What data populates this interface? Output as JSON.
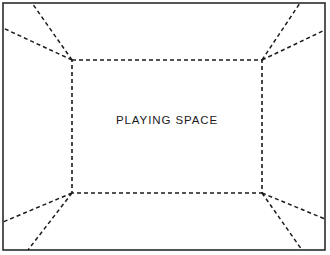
{
  "diagram": {
    "background_color": "#ffffff",
    "canvas": {
      "width": 330,
      "height": 255
    },
    "outer_frame": {
      "name": "outer-boundary",
      "style": "solid",
      "stroke_color": "#2b2b2b",
      "stroke_width": 1.6,
      "x": 3,
      "y": 3,
      "width": 322,
      "height": 247
    },
    "playing_space": {
      "label": "PLAYING SPACE",
      "style": "dashed",
      "stroke_color": "#1b1b1b",
      "stroke_width": 1.6,
      "dash_pattern": "4 3",
      "x": 72,
      "y": 60,
      "width": 190,
      "height": 133
    },
    "sightlines": {
      "style": "dashed",
      "stroke_color": "#1b1b1b",
      "stroke_width": 1.5,
      "dash_pattern": "4 3",
      "count": 8,
      "lines": [
        {
          "name": "sightline-top-left-to-top-edge",
          "x1": 72,
          "y1": 60,
          "x2": 32,
          "y2": 3
        },
        {
          "name": "sightline-top-left-to-left-edge",
          "x1": 72,
          "y1": 60,
          "x2": 3,
          "y2": 28
        },
        {
          "name": "sightline-top-right-to-top-edge",
          "x1": 262,
          "y1": 60,
          "x2": 300,
          "y2": 3
        },
        {
          "name": "sightline-top-right-to-right-edge",
          "x1": 262,
          "y1": 60,
          "x2": 325,
          "y2": 30
        },
        {
          "name": "sightline-bottom-left-to-left-edge",
          "x1": 72,
          "y1": 193,
          "x2": 3,
          "y2": 222
        },
        {
          "name": "sightline-bottom-left-to-bottom-edge",
          "x1": 72,
          "y1": 193,
          "x2": 28,
          "y2": 250
        },
        {
          "name": "sightline-bottom-right-to-right-edge",
          "x1": 262,
          "y1": 193,
          "x2": 325,
          "y2": 219
        },
        {
          "name": "sightline-bottom-right-to-bottom-edge",
          "x1": 262,
          "y1": 193,
          "x2": 302,
          "y2": 250
        }
      ]
    }
  }
}
